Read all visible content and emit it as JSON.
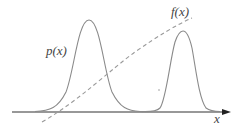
{
  "diagram": {
    "labels": {
      "p": "p(x)",
      "f": "f(x)",
      "axis": "x"
    },
    "colors": {
      "curve": "#8a8a8a",
      "dashed": "#9a9a9a",
      "axis": "#333333",
      "text": "#444444"
    },
    "components": {
      "p_curve": "Bimodal probability density p(x): a tall broad peak on the left and a narrower, slightly shorter peak on the right",
      "f_curve": "Dashed monotonically increasing function f(x) rising from bottom-left to top-right",
      "axis": "Horizontal x-axis with arrowhead pointing right"
    }
  }
}
